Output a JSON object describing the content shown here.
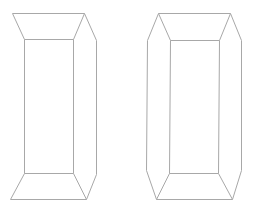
{
  "diagram": {
    "background": "#ffffff",
    "line_color": "#a8a8a8",
    "shapes": [
      {
        "name": "left-prism",
        "outer_path": "12,13 84,13 96,40 96,174 86,199 10,199 24,173 24,39",
        "edges": [
          "12,13 84,13",
          "84,13 96,40",
          "96,40 96,174",
          "96,174 86,199",
          "86,199 10,199",
          "10,199 24,173",
          "24,39 12,13",
          "24,39 73,39",
          "73,39 84,13",
          "24,39 24,173",
          "73,39 73,173",
          "24,173 73,173",
          "73,173 86,199"
        ]
      },
      {
        "name": "right-prism",
        "outer_path": "158,13 230,13 241,40 241,170 232,199 156,199 146,170 147,40",
        "edges": [
          "158,13 230,13",
          "230,13 241,40",
          "241,40 241,170",
          "241,170 232,199",
          "232,199 156,199",
          "156,199 146,170",
          "146,170 147,40",
          "147,40 158,13",
          "158,13 170,40",
          "230,13 219,40",
          "170,40 219,40",
          "170,40 169,173",
          "219,40 218,173",
          "169,173 218,173",
          "169,173 156,199",
          "218,173 232,199"
        ]
      }
    ]
  }
}
